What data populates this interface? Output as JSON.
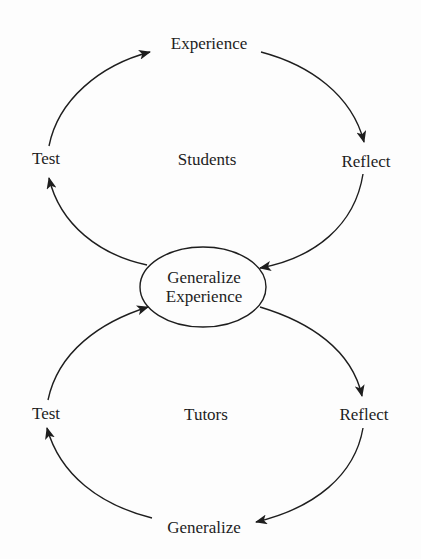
{
  "diagram": {
    "type": "cycle",
    "top_cycle": {
      "group_label": "Students",
      "nodes": [
        "Experience",
        "Reflect",
        "Generalize Experience",
        "Test"
      ]
    },
    "bottom_cycle": {
      "group_label": "Tutors",
      "nodes": [
        "Generalize Experience",
        "Reflect",
        "Generalize",
        "Test"
      ]
    },
    "labels": {
      "experience_top": "Experience",
      "test_top": "Test",
      "students": "Students",
      "reflect_top": "Reflect",
      "center_line1": "Generalize",
      "center_line2": "Experience",
      "test_bottom": "Test",
      "tutors": "Tutors",
      "reflect_bottom": "Reflect",
      "generalize_bottom": "Generalize"
    },
    "edges": [
      {
        "from": "Test",
        "to": "Experience",
        "cycle": "top"
      },
      {
        "from": "Experience",
        "to": "Reflect",
        "cycle": "top"
      },
      {
        "from": "Reflect",
        "to": "Generalize Experience",
        "cycle": "top"
      },
      {
        "from": "Generalize Experience",
        "to": "Test",
        "cycle": "top"
      },
      {
        "from": "Generalize Experience",
        "to": "Reflect",
        "cycle": "bottom"
      },
      {
        "from": "Reflect",
        "to": "Generalize",
        "cycle": "bottom"
      },
      {
        "from": "Generalize",
        "to": "Test",
        "cycle": "bottom"
      },
      {
        "from": "Test",
        "to": "Generalize Experience",
        "cycle": "bottom"
      }
    ],
    "colors": {
      "ink": "#1e1e1e",
      "background": "#fdfdfd"
    }
  }
}
